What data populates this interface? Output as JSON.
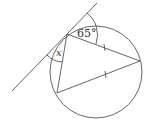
{
  "diagram": {
    "type": "circle-tangent-inscribed-triangle",
    "labels": {
      "angle_top": "65°",
      "angle_x": "x"
    },
    "colors": {
      "stroke": "#555555",
      "background": "#ffffff"
    },
    "tick_marks": "two equal chords from right vertex marked with single ticks"
  }
}
